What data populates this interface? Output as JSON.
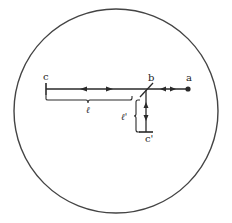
{
  "diagram": {
    "labels": {
      "c": "c",
      "b": "b",
      "a": "a",
      "c_prime": "c'",
      "l": "ℓ",
      "l_prime": "ℓ'"
    },
    "colors": {
      "stroke": "#2a2a2a",
      "background": "#ffffff"
    }
  }
}
